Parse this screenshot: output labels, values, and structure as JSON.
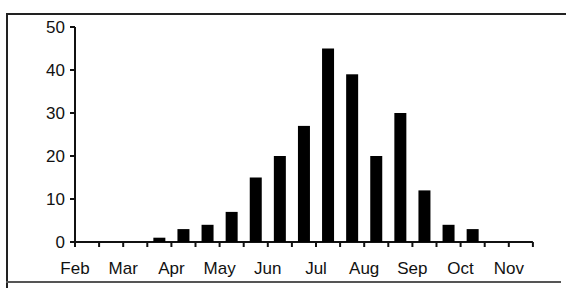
{
  "chart_data": {
    "type": "bar",
    "title": "",
    "xlabel": "",
    "ylabel": "",
    "ylim": [
      0,
      50
    ],
    "yticks": [
      0,
      10,
      20,
      30,
      40,
      50
    ],
    "xtick_labels": [
      "Feb",
      "Mar",
      "Apr",
      "May",
      "Jun",
      "Jul",
      "Aug",
      "Sep",
      "Oct",
      "Nov"
    ],
    "bin_note": "half-month bins",
    "categories": [
      "Apr 1",
      "Apr 2",
      "May 1",
      "May 2",
      "Jun 1",
      "Jun 2",
      "Jul 1",
      "Jul 2",
      "Aug 1",
      "Aug 2",
      "Sep 1",
      "Sep 2",
      "Oct 1",
      "Oct 2"
    ],
    "values": [
      1,
      3,
      4,
      7,
      15,
      20,
      27,
      45,
      39,
      20,
      30,
      12,
      4,
      3
    ],
    "bar_color": "#000000",
    "grid": false,
    "legend": null
  }
}
